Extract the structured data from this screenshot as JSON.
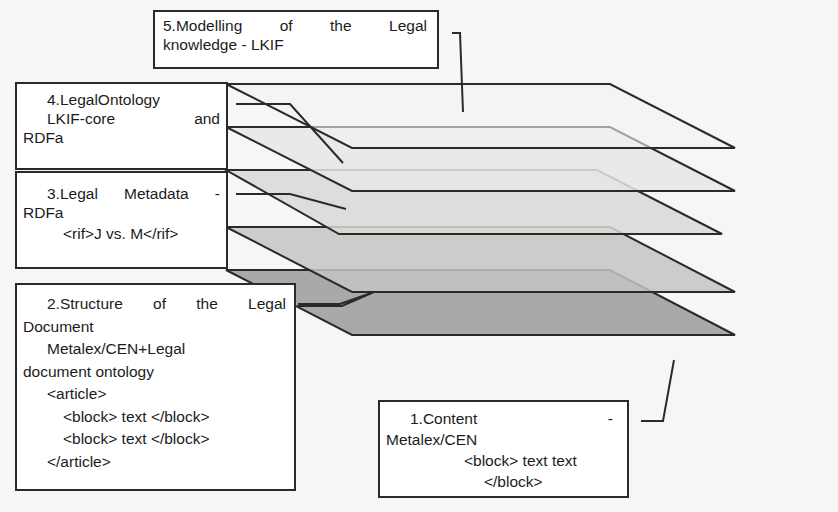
{
  "diagram": {
    "colors": {
      "background": "#f6f6f4",
      "box_fill": "#ffffff",
      "stroke": "#2a2a2a",
      "layer_5": "#f4f4f2",
      "layer_4": "#e6e6e4",
      "layer_3": "#d8d8d6",
      "layer_2": "#c4c4c2",
      "layer_1": "#a9a9a7"
    },
    "layers": [
      {
        "id": 5,
        "lines": [
          [
            "5.Modelling",
            "of",
            "the",
            "Legal"
          ],
          "knowledge - LKIF"
        ]
      },
      {
        "id": 4,
        "lines": [
          "4.LegalOntology",
          [
            "LKIF-core",
            "and"
          ],
          "RDFa"
        ]
      },
      {
        "id": 3,
        "lines": [
          [
            "3.Legal",
            "Metadata",
            "-"
          ],
          "RDFa",
          "<rif>J vs. M</rif>"
        ]
      },
      {
        "id": 2,
        "lines": [
          [
            "2.Structure",
            "of",
            "the",
            "Legal"
          ],
          "Document",
          "Metalex/CEN+Legal",
          "document ontology",
          "<article>",
          "<block> text </block>",
          "<block> text </block>",
          "</article>"
        ]
      },
      {
        "id": 1,
        "lines": [
          [
            "1.Content",
            "-"
          ],
          "Metalex/CEN",
          "<block> text text",
          "</block>"
        ]
      }
    ]
  },
  "text": {
    "l5_w1": "5.Modelling",
    "l5_w2": "of",
    "l5_w3": "the",
    "l5_w4": "Legal",
    "l5_line2": "knowledge - LKIF",
    "l4_line1": "4.LegalOntology",
    "l4_w1": "LKIF-core",
    "l4_w2": "and",
    "l4_line3": "RDFa",
    "l3_w1": "3.Legal",
    "l3_w2": "Metadata",
    "l3_w3": "-",
    "l3_line2": "RDFa",
    "l3_line3": "<rif>J vs. M</rif>",
    "l2_w1": "2.Structure",
    "l2_w2": "of",
    "l2_w3": "the",
    "l2_w4": "Legal",
    "l2_line2": "Document",
    "l2_line3": "Metalex/CEN+Legal",
    "l2_line4": "document ontology",
    "l2_line5": "<article>",
    "l2_line6": "<block> text </block>",
    "l2_line7": "<block> text </block>",
    "l2_line8": "</article>",
    "l1_w1": "1.Content",
    "l1_w2": "-",
    "l1_line2": "Metalex/CEN",
    "l1_line3": "<block> text text",
    "l1_line4": "</block>"
  }
}
